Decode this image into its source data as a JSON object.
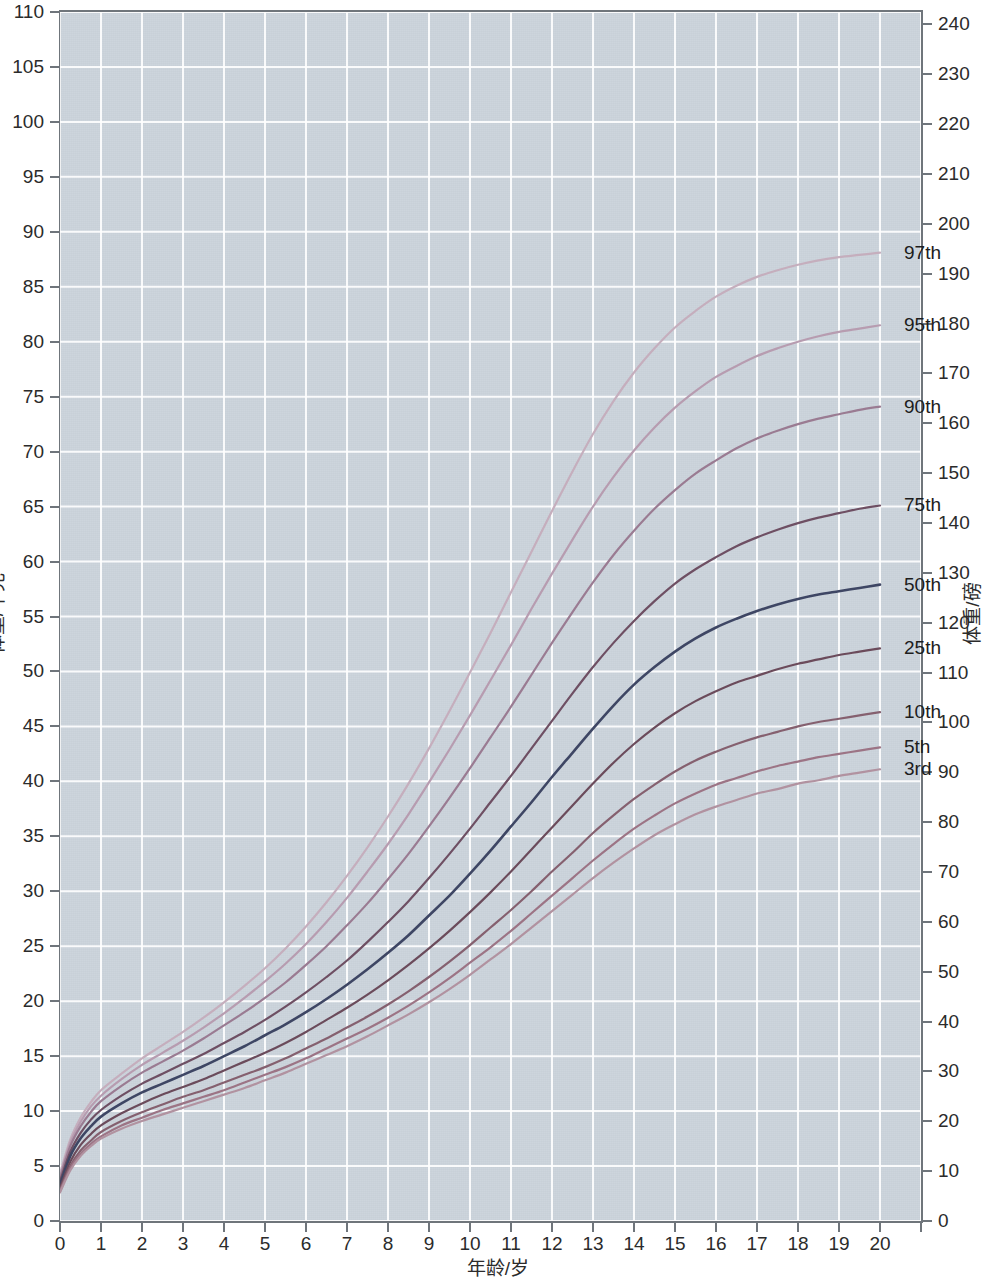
{
  "figure": {
    "background_color": "#ccd4dc",
    "grid_color": "#ffffff",
    "axis_color": "#6f757b",
    "text_color": "#2b2b2b"
  },
  "axes": {
    "x": {
      "title": "年龄/岁",
      "ticks": [
        0,
        1,
        2,
        3,
        4,
        5,
        6,
        7,
        8,
        9,
        10,
        11,
        12,
        13,
        14,
        15,
        16,
        17,
        18,
        19,
        20,
        21
      ],
      "tick_labels": [
        "0",
        "1",
        "2",
        "3",
        "4",
        "5",
        "6",
        "7",
        "8",
        "9",
        "10",
        "11",
        "12",
        "13",
        "14",
        "15",
        "16",
        "17",
        "18",
        "19",
        "20",
        ""
      ],
      "range": [
        0,
        21
      ]
    },
    "y_left": {
      "title": "体重/千克",
      "ticks": [
        0,
        5,
        10,
        15,
        20,
        25,
        30,
        35,
        40,
        45,
        50,
        55,
        60,
        65,
        70,
        75,
        80,
        85,
        90,
        95,
        100,
        105,
        110
      ],
      "tick_labels": [
        "0",
        "5",
        "10",
        "15",
        "20",
        "25",
        "30",
        "35",
        "40",
        "45",
        "50",
        "55",
        "60",
        "65",
        "70",
        "75",
        "80",
        "85",
        "90",
        "95",
        "100",
        "105",
        "110"
      ],
      "range": [
        0,
        110
      ]
    },
    "y_right": {
      "title": "体重/磅",
      "ticks": [
        0,
        10,
        20,
        30,
        40,
        50,
        60,
        70,
        80,
        90,
        100,
        110,
        120,
        130,
        140,
        150,
        160,
        170,
        180,
        190,
        200,
        210,
        220,
        230,
        240
      ],
      "tick_labels": [
        "0",
        "10",
        "20",
        "30",
        "40",
        "50",
        "60",
        "70",
        "80",
        "90",
        "100",
        "110",
        "120",
        "130",
        "140",
        "150",
        "160",
        "170",
        "180",
        "190",
        "200",
        "210",
        "220",
        "230",
        "240"
      ],
      "range": [
        0,
        242.5
      ]
    }
  },
  "chart_data": {
    "type": "line",
    "title": "",
    "subtitle": "",
    "xlabel": "年龄/岁",
    "ylabel": "体重/千克",
    "ylabel_secondary": "体重/磅",
    "xlim": [
      0,
      21
    ],
    "ylim": [
      0,
      110
    ],
    "ylim_secondary": [
      0,
      242.5
    ],
    "grid": true,
    "grid_x_step": 1,
    "grid_y_step": 5,
    "legend_position": "right-inline-labels",
    "x": [
      0,
      0.25,
      0.5,
      0.75,
      1,
      1.5,
      2,
      2.5,
      3,
      3.5,
      4,
      4.5,
      5,
      5.5,
      6,
      6.5,
      7,
      7.5,
      8,
      8.5,
      9,
      9.5,
      10,
      10.5,
      11,
      11.5,
      12,
      12.5,
      13,
      13.5,
      14,
      14.5,
      15,
      15.5,
      16,
      16.5,
      17,
      17.5,
      18,
      18.5,
      19,
      19.5,
      20
    ],
    "series": [
      {
        "name": "97th",
        "label": "97th",
        "color": "#c5aebd",
        "values": [
          4.3,
          7.4,
          9.4,
          10.8,
          11.9,
          13.4,
          14.8,
          16.0,
          17.2,
          18.5,
          19.9,
          21.4,
          23.0,
          24.8,
          26.8,
          29.0,
          31.4,
          34.0,
          36.8,
          39.8,
          43.0,
          46.4,
          49.9,
          53.5,
          57.2,
          60.9,
          64.6,
          68.2,
          71.6,
          74.6,
          77.2,
          79.4,
          81.3,
          82.8,
          84.1,
          85.1,
          85.9,
          86.5,
          87.0,
          87.4,
          87.7,
          87.9,
          88.1
        ]
      },
      {
        "name": "95th",
        "label": "95th",
        "color": "#b79cb0",
        "values": [
          4.1,
          7.1,
          9.0,
          10.4,
          11.4,
          12.9,
          14.2,
          15.3,
          16.4,
          17.6,
          18.9,
          20.3,
          21.8,
          23.4,
          25.2,
          27.2,
          29.4,
          31.8,
          34.3,
          37.0,
          39.9,
          42.9,
          46.0,
          49.2,
          52.4,
          55.7,
          58.9,
          62.0,
          65.0,
          67.7,
          70.1,
          72.2,
          74.0,
          75.5,
          76.8,
          77.8,
          78.7,
          79.4,
          80.0,
          80.5,
          80.9,
          81.2,
          81.5
        ]
      },
      {
        "name": "90th",
        "label": "90th",
        "color": "#9a7b92",
        "values": [
          3.9,
          6.8,
          8.6,
          9.9,
          10.9,
          12.3,
          13.5,
          14.5,
          15.5,
          16.6,
          17.8,
          19.0,
          20.3,
          21.7,
          23.3,
          25.0,
          26.9,
          28.9,
          31.1,
          33.4,
          35.9,
          38.5,
          41.2,
          44.0,
          46.8,
          49.7,
          52.6,
          55.4,
          58.1,
          60.6,
          62.8,
          64.8,
          66.5,
          68.0,
          69.2,
          70.3,
          71.2,
          71.9,
          72.5,
          73.0,
          73.4,
          73.8,
          74.1
        ]
      },
      {
        "name": "75th",
        "label": "75th",
        "color": "#6e4f63",
        "values": [
          3.6,
          6.3,
          8.0,
          9.2,
          10.1,
          11.4,
          12.5,
          13.4,
          14.3,
          15.2,
          16.2,
          17.2,
          18.3,
          19.5,
          20.8,
          22.2,
          23.7,
          25.4,
          27.2,
          29.1,
          31.2,
          33.4,
          35.7,
          38.1,
          40.5,
          43.0,
          45.5,
          48.0,
          50.4,
          52.6,
          54.6,
          56.4,
          58.0,
          59.3,
          60.4,
          61.4,
          62.2,
          62.9,
          63.5,
          64.0,
          64.4,
          64.8,
          65.1
        ]
      },
      {
        "name": "50th",
        "label": "50th",
        "color": "#3e4664",
        "values": [
          3.3,
          5.9,
          7.5,
          8.6,
          9.5,
          10.7,
          11.7,
          12.5,
          13.3,
          14.1,
          15.0,
          15.9,
          16.9,
          17.9,
          19.0,
          20.2,
          21.5,
          22.9,
          24.4,
          26.0,
          27.8,
          29.6,
          31.6,
          33.7,
          35.9,
          38.1,
          40.4,
          42.6,
          44.8,
          46.9,
          48.8,
          50.4,
          51.8,
          53.0,
          54.0,
          54.8,
          55.5,
          56.1,
          56.6,
          57.0,
          57.3,
          57.6,
          57.9
        ]
      },
      {
        "name": "25th",
        "label": "25th",
        "color": "#6b4b5b",
        "values": [
          3.0,
          5.4,
          6.9,
          7.9,
          8.7,
          9.8,
          10.7,
          11.5,
          12.2,
          12.9,
          13.7,
          14.5,
          15.3,
          16.2,
          17.2,
          18.3,
          19.4,
          20.6,
          21.9,
          23.3,
          24.8,
          26.4,
          28.1,
          29.9,
          31.8,
          33.8,
          35.8,
          37.8,
          39.8,
          41.7,
          43.4,
          44.9,
          46.2,
          47.3,
          48.2,
          49.0,
          49.6,
          50.2,
          50.7,
          51.1,
          51.5,
          51.8,
          52.1
        ]
      },
      {
        "name": "10th",
        "label": "10th",
        "color": "#85606f",
        "values": [
          2.8,
          5.0,
          6.4,
          7.3,
          8.1,
          9.1,
          9.9,
          10.6,
          11.3,
          11.9,
          12.6,
          13.3,
          14.0,
          14.8,
          15.7,
          16.6,
          17.6,
          18.6,
          19.7,
          20.9,
          22.2,
          23.6,
          25.1,
          26.7,
          28.3,
          30.0,
          31.8,
          33.5,
          35.3,
          36.9,
          38.4,
          39.7,
          40.9,
          41.9,
          42.7,
          43.4,
          44.0,
          44.5,
          45.0,
          45.4,
          45.7,
          46.0,
          46.3
        ]
      },
      {
        "name": "5th",
        "label": "5th",
        "color": "#9c7485",
        "values": [
          2.7,
          4.8,
          6.1,
          7.0,
          7.7,
          8.7,
          9.4,
          10.1,
          10.7,
          11.3,
          11.9,
          12.6,
          13.3,
          14.0,
          14.8,
          15.7,
          16.6,
          17.5,
          18.5,
          19.6,
          20.8,
          22.1,
          23.5,
          24.9,
          26.4,
          28.0,
          29.6,
          31.2,
          32.8,
          34.3,
          35.7,
          36.9,
          38.0,
          38.9,
          39.7,
          40.3,
          40.9,
          41.4,
          41.8,
          42.2,
          42.5,
          42.8,
          43.1
        ]
      },
      {
        "name": "3rd",
        "label": "3rd",
        "color": "#b192a0",
        "values": [
          2.6,
          4.6,
          5.9,
          6.8,
          7.5,
          8.4,
          9.1,
          9.7,
          10.3,
          10.9,
          11.5,
          12.1,
          12.8,
          13.5,
          14.3,
          15.1,
          15.9,
          16.8,
          17.8,
          18.8,
          19.9,
          21.1,
          22.4,
          23.8,
          25.2,
          26.7,
          28.2,
          29.7,
          31.2,
          32.6,
          33.9,
          35.1,
          36.1,
          37.0,
          37.7,
          38.3,
          38.9,
          39.3,
          39.8,
          40.1,
          40.5,
          40.8,
          41.1
        ]
      }
    ],
    "annotations": [
      {
        "text": "97th",
        "x": 20.0,
        "y": 88.1
      },
      {
        "text": "95th",
        "x": 20.0,
        "y": 81.5
      },
      {
        "text": "90th",
        "x": 20.0,
        "y": 74.1
      },
      {
        "text": "75th",
        "x": 20.0,
        "y": 65.1
      },
      {
        "text": "50th",
        "x": 20.0,
        "y": 57.9
      },
      {
        "text": "25th",
        "x": 20.0,
        "y": 52.1
      },
      {
        "text": "10th",
        "x": 20.0,
        "y": 46.3
      },
      {
        "text": "5th",
        "x": 20.0,
        "y": 43.1
      },
      {
        "text": "3rd",
        "x": 20.0,
        "y": 41.1
      }
    ]
  }
}
